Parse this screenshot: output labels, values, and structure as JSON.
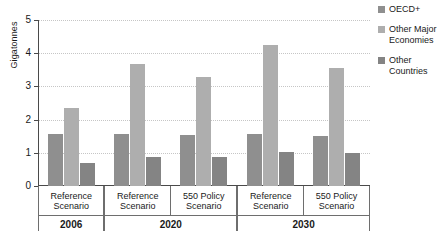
{
  "chart_data": {
    "type": "bar",
    "title": "",
    "xlabel": "",
    "ylabel": "Gigatonnes",
    "ylim": [
      0,
      5
    ],
    "yticks": [
      0,
      1,
      2,
      3,
      4,
      5
    ],
    "ytick_labels": [
      "0",
      "1",
      "2",
      "3",
      "4",
      "5"
    ],
    "grid": true,
    "legend_position": "right",
    "categories": [
      "2006 Reference Scenario",
      "2020 Reference Scenario",
      "2020 550 Policy Scenario",
      "2030 Reference Scenario",
      "2030 550 Policy Scenario"
    ],
    "series": [
      {
        "name": "OECD+",
        "color": "#8f8f8f",
        "values": [
          1.58,
          1.56,
          1.54,
          1.57,
          1.51
        ]
      },
      {
        "name": "Other Major Economies",
        "color": "#aeaeae",
        "values": [
          2.35,
          3.67,
          3.27,
          4.24,
          3.55
        ]
      },
      {
        "name": "Other Countries",
        "color": "#848484",
        "values": [
          0.68,
          0.87,
          0.87,
          1.01,
          0.98
        ]
      }
    ],
    "periods": [
      {
        "period_label": "2006",
        "scenarios": [
          {
            "line1": "Reference",
            "line2": "Scenario"
          }
        ]
      },
      {
        "period_label": "2020",
        "scenarios": [
          {
            "line1": "Reference",
            "line2": "Scenario"
          },
          {
            "line1": "550 Policy",
            "line2": "Scenario"
          }
        ]
      },
      {
        "period_label": "2030",
        "scenarios": [
          {
            "line1": "Reference",
            "line2": "Scenario"
          },
          {
            "line1": "550 Policy",
            "line2": "Scenario"
          }
        ]
      }
    ]
  },
  "legend": {
    "items": [
      {
        "label": "OECD+",
        "color": "#8f8f8f"
      },
      {
        "label": "Other Major Economies",
        "color": "#aeaeae"
      },
      {
        "label": "Other Countries",
        "color": "#848484"
      }
    ]
  },
  "axis": {
    "y_title": "Gigatonnes"
  }
}
